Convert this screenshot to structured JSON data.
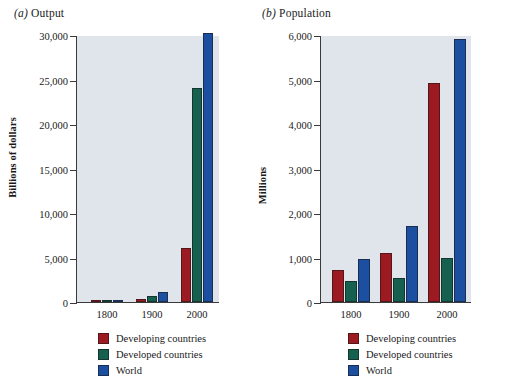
{
  "figure": {
    "background": "#ffffff",
    "plot_background": "#dfe5ea",
    "axis_color": "#3a3a3a"
  },
  "series_colors": {
    "developing": "#9c1b23",
    "developed": "#15604f",
    "world": "#1d4fa0"
  },
  "legend": {
    "items": [
      {
        "label": "Developing countries",
        "color": "#9c1b23",
        "key": "developing"
      },
      {
        "label": "Developed countries",
        "color": "#15604f",
        "key": "developed"
      },
      {
        "label": "World",
        "color": "#1d4fa0",
        "key": "world"
      }
    ]
  },
  "panels": [
    {
      "id": "a",
      "panel_letter": "(a)",
      "panel_name": "Output",
      "title": "(a) Output"
    },
    {
      "id": "b",
      "panel_letter": "(b)",
      "panel_name": "Population",
      "title": "(b) Population"
    }
  ],
  "chart_data": [
    {
      "type": "bar",
      "title": "(a) Output",
      "xlabel": "",
      "ylabel": "Billions of dollars",
      "categories": [
        "1800",
        "1900",
        "2000"
      ],
      "ylim": [
        0,
        30000
      ],
      "yticks": [
        0,
        5000,
        10000,
        15000,
        20000,
        25000,
        30000
      ],
      "ytick_labels": [
        "0",
        "5,000",
        "10,000",
        "15,000",
        "20,000",
        "25,000",
        "30,000"
      ],
      "grid": false,
      "legend_position": "bottom",
      "series": [
        {
          "name": "Developing countries",
          "color": "#9c1b23",
          "values": [
            120,
            300,
            6100
          ]
        },
        {
          "name": "Developed countries",
          "color": "#15604f",
          "values": [
            110,
            700,
            24100
          ]
        },
        {
          "name": "World",
          "color": "#1d4fa0",
          "values": [
            230,
            1100,
            30200
          ]
        }
      ]
    },
    {
      "type": "bar",
      "title": "(b) Population",
      "xlabel": "",
      "ylabel": "Millions",
      "categories": [
        "1800",
        "1900",
        "2000"
      ],
      "ylim": [
        0,
        6000
      ],
      "yticks": [
        0,
        1000,
        2000,
        3000,
        4000,
        5000,
        6000
      ],
      "ytick_labels": [
        "0",
        "1,000",
        "2,000",
        "3,000",
        "4,000",
        "5,000",
        "6,000"
      ],
      "grid": false,
      "legend_position": "bottom",
      "series": [
        {
          "name": "Developing countries",
          "color": "#9c1b23",
          "values": [
            720,
            1100,
            4930
          ]
        },
        {
          "name": "Developed countries",
          "color": "#15604f",
          "values": [
            470,
            550,
            990
          ]
        },
        {
          "name": "World",
          "color": "#1d4fa0",
          "values": [
            970,
            1700,
            5900
          ]
        }
      ]
    }
  ]
}
